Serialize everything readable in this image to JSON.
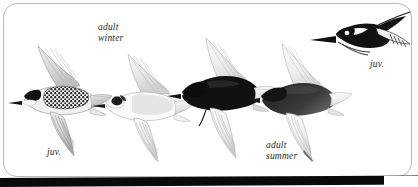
{
  "plate": {
    "name": "tern-flight-plate",
    "background_color": "#ffffff",
    "border_color": "#b9b9b9",
    "bottom_band_color": "#0a0a0a",
    "ink_dark": "#111111",
    "ink_mid": "#7d7d7d",
    "ink_light": "#d8d8d8"
  },
  "labels": {
    "adult_winter": "adult\nwinter",
    "juv_left": "juv.",
    "adult_summer": "adult\nsummer",
    "juv_right": "juv."
  },
  "birds": [
    {
      "id": "bird-1",
      "plumage": "juv.",
      "view": "underside-flight",
      "position": "lower-left"
    },
    {
      "id": "bird-2",
      "plumage": "adult winter",
      "view": "underside-flight",
      "position": "left-center"
    },
    {
      "id": "bird-3",
      "plumage": "adult summer",
      "view": "underside-flight",
      "position": "center"
    },
    {
      "id": "bird-4",
      "plumage": "adult summer",
      "view": "underside-flight",
      "position": "right-center"
    },
    {
      "id": "bird-5",
      "plumage": "juv.",
      "view": "upperside-flight",
      "position": "upper-right"
    }
  ]
}
